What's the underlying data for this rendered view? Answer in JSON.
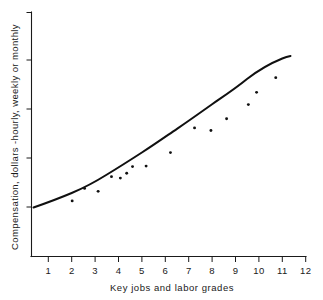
{
  "chart_data": {
    "type": "scatter",
    "title": "",
    "xlabel": "Key jobs and labor grades",
    "ylabel": "Compensation, dollars -hourly, weekly or monthly",
    "grid": false,
    "legend": null,
    "xlim": [
      0,
      12.6
    ],
    "ylim": [
      0,
      10
    ],
    "x_ticks": [
      1,
      2,
      3,
      4,
      5,
      6,
      7,
      8,
      9,
      10,
      11,
      12
    ],
    "x_tick_labels": [
      "1",
      "2",
      "3",
      "4",
      "5",
      "6",
      "7",
      "8",
      "9",
      "10",
      "11",
      "12"
    ],
    "y_ticks": [
      2.0,
      4.0,
      6.0,
      8.0,
      10.0
    ],
    "y_tick_labels": [
      "",
      "",
      "",
      "",
      ""
    ],
    "points": [
      {
        "x": 2.02,
        "y": 2.27
      },
      {
        "x": 2.55,
        "y": 2.78
      },
      {
        "x": 3.13,
        "y": 2.66
      },
      {
        "x": 3.7,
        "y": 3.26
      },
      {
        "x": 4.08,
        "y": 3.2
      },
      {
        "x": 4.35,
        "y": 3.4
      },
      {
        "x": 4.6,
        "y": 3.67
      },
      {
        "x": 5.18,
        "y": 3.69
      },
      {
        "x": 6.22,
        "y": 4.24
      },
      {
        "x": 7.25,
        "y": 5.25
      },
      {
        "x": 7.95,
        "y": 5.14
      },
      {
        "x": 8.62,
        "y": 5.62
      },
      {
        "x": 9.55,
        "y": 6.2
      },
      {
        "x": 9.9,
        "y": 6.7
      },
      {
        "x": 10.72,
        "y": 7.3
      }
    ],
    "trend_curve": {
      "label": "fitted wage line",
      "x": [
        0.25,
        1.0,
        2.0,
        3.0,
        4.0,
        5.0,
        6.0,
        7.0,
        8.0,
        9.0,
        10.0,
        11.0
      ],
      "y": [
        1.88,
        2.12,
        2.48,
        2.9,
        3.34,
        3.76,
        4.3,
        4.85,
        5.4,
        6.0,
        6.8,
        7.75
      ]
    }
  },
  "axes": {
    "x_caption": "Key jobs and labor grades",
    "y_caption": "Compensation, dollars -hourly, weekly or monthly"
  },
  "colors": {
    "ink": "#1a1a1a",
    "curve": "#101010",
    "background": "#ffffff"
  }
}
